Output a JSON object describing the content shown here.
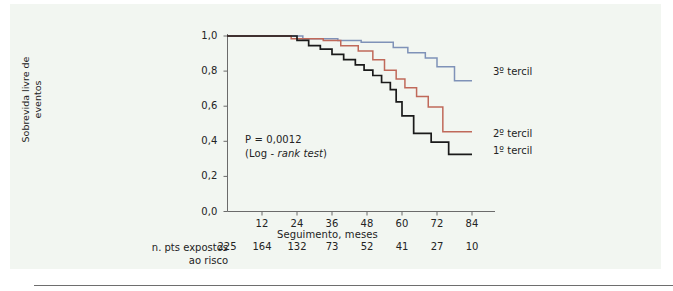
{
  "figure": {
    "background_color": "#f2f6f1",
    "page_background": "#ffffff"
  },
  "chart_data": {
    "type": "line",
    "subtype": "kaplan-meier-step",
    "title": "",
    "xlabel": "Seguimento, meses",
    "ylabel": "Sobrevida livre de eventos",
    "xlim": [
      0,
      90
    ],
    "ylim": [
      0,
      1
    ],
    "xticks": [
      12,
      24,
      36,
      48,
      60,
      72,
      84
    ],
    "xticklabels": [
      "12",
      "24",
      "36",
      "48",
      "60",
      "72",
      "84"
    ],
    "yticks": [
      0,
      0.2,
      0.4,
      0.6,
      0.8,
      1.0
    ],
    "yticklabels": [
      "0,0",
      "0,2",
      "0,4",
      "0,6",
      "0,8",
      "1,0"
    ],
    "grid": false,
    "legend_position": "right-inline",
    "annotations": [
      {
        "text_line1": "P = 0,0012",
        "text_line2_prefix": "(Log - ",
        "text_line2_italic": "rank test",
        "text_line2_suffix": ")"
      }
    ],
    "series": [
      {
        "name": "3º tercil",
        "color": "#7f92b8",
        "label": "3º tercil",
        "x": [
          0,
          26,
          26,
          38,
          38,
          46,
          46,
          57,
          57,
          62,
          62,
          68,
          68,
          72,
          72,
          78,
          78,
          84
        ],
        "y": [
          1.0,
          1.0,
          0.985,
          0.985,
          0.975,
          0.975,
          0.965,
          0.965,
          0.935,
          0.935,
          0.905,
          0.905,
          0.875,
          0.875,
          0.825,
          0.825,
          0.745,
          0.745
        ]
      },
      {
        "name": "2º tercil",
        "color": "#c0695a",
        "label": "2º tercil",
        "x": [
          0,
          22,
          22,
          33,
          33,
          39,
          39,
          45,
          45,
          50,
          50,
          54,
          54,
          58,
          58,
          61,
          61,
          65,
          65,
          69,
          69,
          74,
          74,
          84
        ],
        "y": [
          1.0,
          1.0,
          0.985,
          0.985,
          0.975,
          0.975,
          0.945,
          0.945,
          0.915,
          0.915,
          0.865,
          0.865,
          0.805,
          0.805,
          0.755,
          0.755,
          0.705,
          0.705,
          0.655,
          0.655,
          0.595,
          0.595,
          0.455,
          0.455
        ]
      },
      {
        "name": "1º tercil",
        "color": "#1a1a1a",
        "label": "1º tercil",
        "x": [
          0,
          24,
          24,
          28,
          28,
          32,
          32,
          36,
          36,
          40,
          40,
          44,
          44,
          47,
          47,
          50,
          50,
          53,
          53,
          56,
          56,
          58,
          58,
          60,
          60,
          64,
          64,
          70,
          70,
          76,
          76,
          84
        ],
        "y": [
          1.0,
          1.0,
          0.975,
          0.975,
          0.945,
          0.945,
          0.925,
          0.925,
          0.895,
          0.895,
          0.865,
          0.865,
          0.835,
          0.835,
          0.805,
          0.805,
          0.775,
          0.775,
          0.735,
          0.735,
          0.695,
          0.695,
          0.625,
          0.625,
          0.545,
          0.545,
          0.445,
          0.445,
          0.395,
          0.395,
          0.325,
          0.325
        ]
      }
    ],
    "risk_table": {
      "label_line1": "n. pts expostos",
      "label_line2": "ao risco",
      "x_positions": [
        0,
        12,
        24,
        36,
        48,
        60,
        72,
        84
      ],
      "counts": [
        "225",
        "164",
        "132",
        "73",
        "52",
        "41",
        "27",
        "10"
      ]
    }
  }
}
